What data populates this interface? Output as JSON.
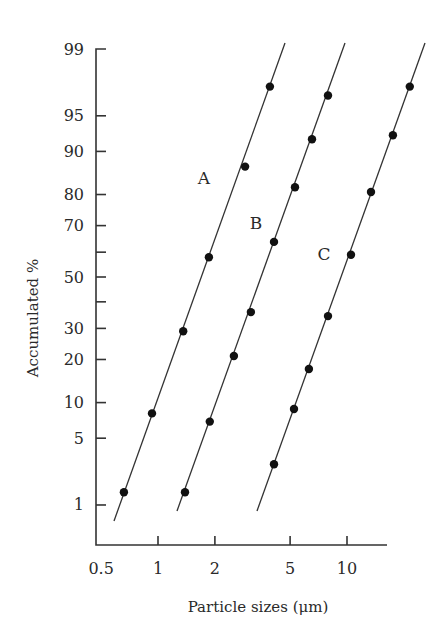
{
  "chart_data": {
    "type": "line",
    "title": "",
    "xlabel": "Particle sizes (μm)",
    "ylabel": "Accumulated %",
    "x_scale": "log",
    "y_scale": "probability",
    "x_ticks": [
      0.5,
      1,
      2,
      5,
      10
    ],
    "x_tick_labels": [
      "0.5",
      "1",
      "2",
      "5",
      "10"
    ],
    "y_ticks": [
      1,
      5,
      10,
      20,
      30,
      40,
      50,
      60,
      70,
      80,
      90,
      95,
      99
    ],
    "y_tick_labels": [
      "1",
      "5",
      "10",
      "20",
      "30",
      "",
      "50",
      "",
      "70",
      "80",
      "90",
      "95",
      "99"
    ],
    "xlim": [
      0.5,
      30
    ],
    "ylim": [
      0.5,
      99.5
    ],
    "grid": false,
    "legend": "inline labels",
    "series": [
      {
        "name": "A",
        "x": [
          0.66,
          0.93,
          1.36,
          1.86,
          2.89,
          3.91
        ],
        "y": [
          1.4,
          8.2,
          29,
          58,
          87,
          97.4
        ]
      },
      {
        "name": "B",
        "x": [
          1.39,
          1.88,
          2.52,
          3.1,
          4.11,
          5.31,
          6.53,
          7.93
        ],
        "y": [
          1.4,
          7,
          21,
          36,
          64,
          82,
          92,
          96.8
        ]
      },
      {
        "name": "C",
        "x": [
          4.11,
          5.24,
          6.29,
          7.93,
          10.5,
          13.4,
          17.5,
          21.5
        ],
        "y": [
          2.8,
          8.9,
          17.4,
          34.5,
          59,
          80.7,
          92.6,
          97.4
        ]
      }
    ]
  },
  "layout": {
    "plot": {
      "x0": 96,
      "y_axis_top": 49,
      "x_axis_y": 545,
      "x_axis_end": 387
    },
    "x_map": {
      "px_at_1": 158,
      "px_per_decade": 189
    },
    "y_map": {
      "px_at_50": 277,
      "px_per_z": 98
    },
    "series_lines": [
      {
        "name": "A",
        "from": [
          114,
          521
        ],
        "to": [
          285,
          43
        ],
        "label_pos": [
          204,
          184
        ]
      },
      {
        "name": "B",
        "from": [
          177,
          511
        ],
        "to": [
          345,
          43
        ],
        "label_pos": [
          256,
          229
        ]
      },
      {
        "name": "C",
        "from": [
          257,
          511
        ],
        "to": [
          425,
          43
        ],
        "label_pos": [
          324,
          260
        ]
      }
    ]
  }
}
